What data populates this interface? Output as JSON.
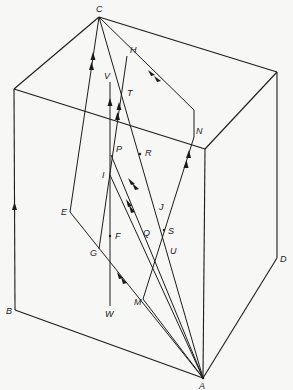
{
  "diagram": {
    "type": "3D box with ray paths",
    "box_vertices": {
      "C": [
        99,
        17
      ],
      "top_left_front": [
        14,
        89
      ],
      "top_right_back": [
        277,
        72
      ],
      "top_right_front": [
        205,
        149
      ],
      "B": [
        15,
        310
      ],
      "A": [
        203,
        378
      ],
      "D": [
        277,
        258
      ]
    },
    "points": {
      "C": {
        "xy": [
          99,
          17
        ],
        "label": "C",
        "lx": 96,
        "ly": 12
      },
      "H": {
        "xy": [
          127,
          56
        ],
        "label": "H",
        "lx": 130,
        "ly": 53
      },
      "V": {
        "xy": [
          110,
          82
        ],
        "label": "V",
        "lx": 104,
        "ly": 79
      },
      "T": {
        "xy": [
          123,
          98
        ],
        "label": "T",
        "lx": 127,
        "ly": 96
      },
      "N": {
        "xy": [
          194,
          137
        ],
        "label": "N",
        "lx": 196,
        "ly": 134
      },
      "P": {
        "xy": [
          111,
          155
        ],
        "label": "P",
        "lx": 116,
        "ly": 152
      },
      "R": {
        "xy": [
          140,
          154
        ],
        "label": "R",
        "lx": 145,
        "ly": 153
      },
      "I": {
        "xy": [
          110,
          175
        ],
        "label": "I",
        "lx": 102,
        "ly": 178
      },
      "J": {
        "xy": [
          155,
          206
        ],
        "label": "J",
        "lx": 159,
        "ly": 210
      },
      "E": {
        "xy": [
          70,
          212
        ],
        "label": "E",
        "lx": 61,
        "ly": 215
      },
      "F": {
        "xy": [
          110,
          236
        ],
        "label": "F",
        "lx": 115,
        "ly": 239
      },
      "Q": {
        "xy": [
          152,
          232
        ],
        "label": "Q",
        "lx": 143,
        "ly": 236
      },
      "S": {
        "xy": [
          164,
          230
        ],
        "label": "S",
        "lx": 168,
        "ly": 234
      },
      "G": {
        "xy": [
          99,
          249
        ],
        "label": "G",
        "lx": 90,
        "ly": 256
      },
      "U": {
        "xy": [
          167,
          248
        ],
        "label": "U",
        "lx": 170,
        "ly": 254
      },
      "M": {
        "xy": [
          143,
          299
        ],
        "label": "M",
        "lx": 134,
        "ly": 305
      },
      "W": {
        "xy": [
          110,
          306
        ],
        "label": "W",
        "lx": 105,
        "ly": 317
      },
      "B": {
        "xy": [
          15,
          310
        ],
        "label": "B",
        "lx": 6,
        "ly": 314
      },
      "D": {
        "xy": [
          277,
          258
        ],
        "label": "D",
        "lx": 280,
        "ly": 262
      },
      "A": {
        "xy": [
          203,
          378
        ],
        "label": "A",
        "lx": 199,
        "ly": 389
      }
    },
    "labels": [
      "C",
      "H",
      "V",
      "T",
      "N",
      "P",
      "R",
      "I",
      "J",
      "E",
      "F",
      "Q",
      "S",
      "G",
      "U",
      "M",
      "W",
      "B",
      "D",
      "A"
    ]
  }
}
